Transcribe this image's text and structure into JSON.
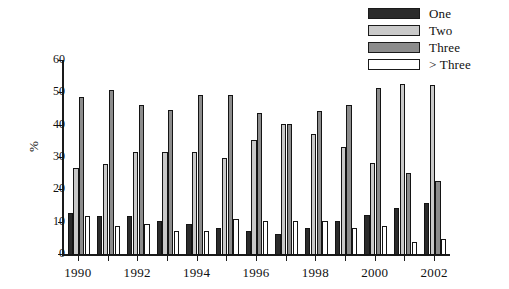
{
  "chart_data": {
    "type": "bar",
    "title": "",
    "xlabel": "",
    "ylabel": "%",
    "ylim": [
      0,
      60
    ],
    "ytick_values": [
      0,
      10,
      20,
      30,
      40,
      50,
      60
    ],
    "ytick_labels": [
      "0",
      "10",
      "20",
      "30",
      "40",
      "50",
      "60"
    ],
    "grid": false,
    "legend_position": "top-right",
    "categories": [
      "1990",
      "1991",
      "1992",
      "1993",
      "1994",
      "1995",
      "1996",
      "1997",
      "1998",
      "1999",
      "2000",
      "2001",
      "2002"
    ],
    "xtick_labels": [
      "1990",
      "",
      "1992",
      "",
      "1994",
      "",
      "1996",
      "",
      "1998",
      "",
      "2000",
      "",
      "2002"
    ],
    "series": [
      {
        "name": "One",
        "color": "#2b2b2b",
        "values": [
          13.0,
          12.0,
          12.0,
          10.5,
          9.5,
          8.5,
          7.5,
          6.5,
          8.5,
          10.5,
          12.5,
          14.5,
          16.0
        ]
      },
      {
        "name": "Two",
        "color": "#c9c9c9",
        "values": [
          27.0,
          28.0,
          32.0,
          32.0,
          32.0,
          30.0,
          35.5,
          40.5,
          37.5,
          33.5,
          28.5,
          53.0,
          52.5
        ]
      },
      {
        "name": "Three",
        "color": "#8c8c8c",
        "values": [
          49.0,
          51.0,
          46.5,
          45.0,
          49.5,
          49.5,
          44.0,
          40.5,
          44.5,
          46.5,
          51.5,
          25.5,
          23.0
        ]
      },
      {
        "name": "> Three",
        "color": "#ffffff",
        "values": [
          12.0,
          9.0,
          9.5,
          7.5,
          7.5,
          11.0,
          10.5,
          10.5,
          10.5,
          8.5,
          9.0,
          4.0,
          5.0
        ]
      }
    ]
  },
  "legend": {
    "items": [
      {
        "label": "One",
        "color": "#2b2b2b"
      },
      {
        "label": "Two",
        "color": "#c9c9c9"
      },
      {
        "label": "Three",
        "color": "#8c8c8c"
      },
      {
        "label": "> Three",
        "color": "#ffffff"
      }
    ]
  }
}
